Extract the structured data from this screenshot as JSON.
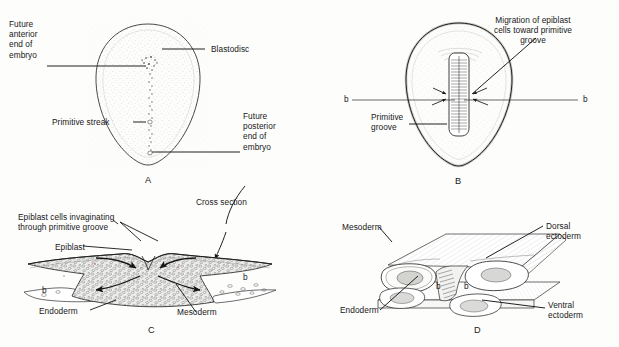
{
  "figure": {
    "background_color": "#fdfdfc",
    "ink_color": "#1a1a1a",
    "stipple_color": "#9a9a96"
  },
  "panels": [
    {
      "id": "A",
      "letter": "A",
      "caption": "Blastodisc in surface view showing the primitive streak",
      "labels": [
        {
          "name": "future-anterior-end",
          "text": "Future\nanterior\nend of\nembryo"
        },
        {
          "name": "blastodisc",
          "text": "Blastodisc"
        },
        {
          "name": "primitive-streak",
          "text": "Primitive streak"
        },
        {
          "name": "future-posterior-end",
          "text": "Future\nposterior\nend of\nembryo"
        }
      ]
    },
    {
      "id": "B",
      "letter": "B",
      "caption": "Blastodisc showing migration of epiblast cells into the primitive groove",
      "labels": [
        {
          "name": "migration-of-epiblast-cells",
          "text": "Migration of epiblast\ncells toward primitive\ngroove"
        },
        {
          "name": "primitive-groove",
          "text": "Primitive\ngroove"
        }
      ],
      "section_markers": [
        {
          "name": "section-marker-b-left",
          "text": "b"
        },
        {
          "name": "section-marker-b-right",
          "text": "b"
        }
      ]
    },
    {
      "id": "C",
      "letter": "C",
      "caption": "Cross section through the primitive groove showing invaginating epiblast cells",
      "labels": [
        {
          "name": "epiblast-cells-invaginating",
          "text": "Epiblast cells invaginating\nthrough primitive groove"
        },
        {
          "name": "epiblast",
          "text": "Epiblast"
        },
        {
          "name": "endoderm",
          "text": "Endoderm"
        },
        {
          "name": "mesoderm",
          "text": "Mesoderm"
        }
      ],
      "section_markers": [
        {
          "name": "section-marker-b-left",
          "text": "b"
        },
        {
          "name": "section-marker-b-right",
          "text": "b"
        }
      ]
    },
    {
      "id": "D",
      "letter": "D",
      "caption": "Three dimensional block showing dorsal and ventral ectoderm, mesoderm and endoderm",
      "labels": [
        {
          "name": "mesoderm",
          "text": "Mesoderm"
        },
        {
          "name": "dorsal-ectoderm",
          "text": "Dorsal\nectoderm"
        },
        {
          "name": "endoderm",
          "text": "Endoderm"
        },
        {
          "name": "ventral-ectoderm",
          "text": "Ventral\nectoderm"
        }
      ],
      "section_markers": [
        {
          "name": "section-marker-b-left",
          "text": "b"
        },
        {
          "name": "section-marker-b-right",
          "text": "b"
        }
      ]
    }
  ],
  "connectors": {
    "cross_section_label": "Cross section"
  }
}
